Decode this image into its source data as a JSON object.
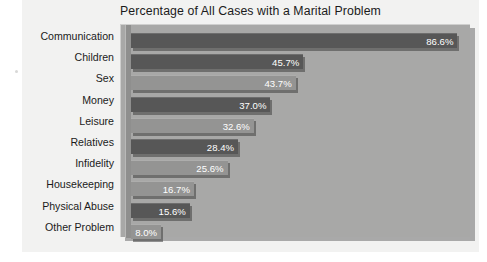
{
  "chart_data": {
    "type": "bar",
    "orientation": "horizontal",
    "title": "Percentage of All Cases with a Marital Problem",
    "xlabel": "",
    "ylabel": "",
    "xlim": [
      0,
      89
    ],
    "grid": false,
    "legend": "none",
    "categories": [
      "Communication",
      "Children",
      "Sex",
      "Money",
      "Leisure",
      "Relatives",
      "Infidelity",
      "Housekeeping",
      "Physical Abuse",
      "Other Problem"
    ],
    "values": [
      86.6,
      45.7,
      43.7,
      37.0,
      32.6,
      28.4,
      25.6,
      16.7,
      15.6,
      8.0
    ],
    "value_labels": [
      "86.6%",
      "45.7%",
      "43.7%",
      "37.0%",
      "32.6%",
      "28.4%",
      "25.6%",
      "16.7%",
      "15.6%",
      "8.0%"
    ],
    "bar_shades": [
      "dark",
      "dark",
      "light",
      "dark",
      "light",
      "dark",
      "light",
      "light",
      "dark",
      "light"
    ]
  },
  "colors": {
    "page_background": "#ffffff",
    "card_background": "#f2f2f1",
    "plot_background": "#a8a8a7",
    "bar_dark": "#575757",
    "bar_light": "#949493",
    "value_label_text": "#ffffff",
    "category_label_text": "#1b1b1b",
    "title_text": "#1b1b1b",
    "axis_spine": "#8f8f8e"
  }
}
